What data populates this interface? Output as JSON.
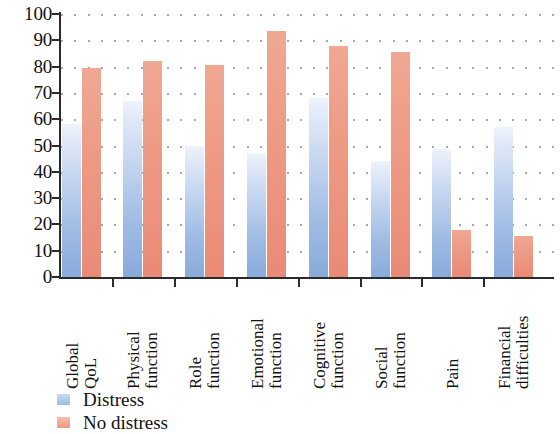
{
  "chart_data": {
    "type": "bar",
    "title": "",
    "subtitle": "",
    "xlabel": "",
    "ylabel": "",
    "ylim": [
      0,
      100
    ],
    "ytick_step": 10,
    "yticks": [
      0,
      10,
      20,
      30,
      40,
      50,
      60,
      70,
      80,
      90,
      100
    ],
    "grid": true,
    "grid_style": "dotted",
    "legend_position": "bottom-left",
    "categories": [
      "Global QoL",
      "Physical function",
      "Role function",
      "Emotional function",
      "Cognitive function",
      "Social function",
      "Pain",
      "Financial difficulties"
    ],
    "category_lines": [
      [
        "Global",
        "QoL"
      ],
      [
        "Physical",
        "function"
      ],
      [
        "Role",
        "function"
      ],
      [
        "Emotional",
        "function"
      ],
      [
        "Cognitive",
        "function"
      ],
      [
        "Social",
        "function"
      ],
      [
        "Pain"
      ],
      [
        "Financial",
        "difficulties"
      ]
    ],
    "series": [
      {
        "name": "Distress",
        "color": "#9ebbe3",
        "values": [
          58,
          67,
          50,
          47,
          68,
          44,
          48.5,
          57
        ]
      },
      {
        "name": "No distress",
        "color": "#ef9b85",
        "values": [
          79.5,
          82,
          80.5,
          93.5,
          88,
          85.5,
          18,
          15.5
        ]
      }
    ]
  },
  "legend": {
    "items": [
      {
        "label": "Distress",
        "swatch": "distress"
      },
      {
        "label": "No distress",
        "swatch": "nodistress"
      }
    ]
  }
}
